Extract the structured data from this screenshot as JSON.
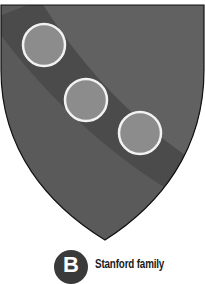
{
  "figure": {
    "shield": {
      "fill": "#5a5a5a",
      "band_fill": "#4b4b4b",
      "light_fill": "#626262",
      "outline": "#111111",
      "roundel_fill": "#8c8c8c",
      "roundel_stroke": "#f2f2f2",
      "roundel_count": 3
    },
    "label": {
      "badge_letter": "B",
      "caption": "Stanford family"
    }
  }
}
